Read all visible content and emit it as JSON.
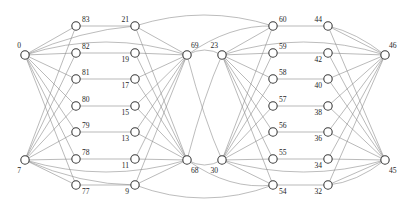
{
  "figure": {
    "width": 408,
    "height": 213,
    "background_color": "#ffffff",
    "node_stroke_color": "#3b3b3b",
    "node_fill_color": "#ffffff",
    "edge_color": "#8c8c8c",
    "label_color": "#262626",
    "node_radius": 4.2
  },
  "chart_data": {
    "type": "graph",
    "title": "",
    "layout": "layered-columns",
    "columns": [
      {
        "name": "column-a-hubs",
        "x": 25,
        "nodes": [
          {
            "id": "0",
            "label": "0",
            "x": 25,
            "y": 55,
            "label_dx": -4,
            "label_dy": -7,
            "anchor": "end"
          },
          {
            "id": "7",
            "label": "7",
            "x": 25,
            "y": 160,
            "label_dx": -4,
            "label_dy": 13,
            "anchor": "end"
          }
        ]
      },
      {
        "name": "column-b",
        "x": 76,
        "nodes": [
          {
            "id": "83",
            "label": "83",
            "x": 76,
            "y": 26,
            "label_dx": 6,
            "label_dy": -4,
            "anchor": "start"
          },
          {
            "id": "82",
            "label": "82",
            "x": 76,
            "y": 53,
            "label_dx": 6,
            "label_dy": -4,
            "anchor": "start"
          },
          {
            "id": "81",
            "label": "81",
            "x": 76,
            "y": 79,
            "label_dx": 6,
            "label_dy": -4,
            "anchor": "start"
          },
          {
            "id": "80",
            "label": "80",
            "x": 76,
            "y": 106,
            "label_dx": 6,
            "label_dy": -4,
            "anchor": "start"
          },
          {
            "id": "79",
            "label": "79",
            "x": 76,
            "y": 132,
            "label_dx": 6,
            "label_dy": -4,
            "anchor": "start"
          },
          {
            "id": "78",
            "label": "78",
            "x": 76,
            "y": 159,
            "label_dx": 6,
            "label_dy": -4,
            "anchor": "start"
          },
          {
            "id": "77",
            "label": "77",
            "x": 76,
            "y": 185,
            "label_dx": 6,
            "label_dy": 9,
            "anchor": "start"
          }
        ]
      },
      {
        "name": "column-c",
        "x": 135,
        "nodes": [
          {
            "id": "21",
            "label": "21",
            "x": 135,
            "y": 26,
            "label_dx": -6,
            "label_dy": -4,
            "anchor": "end"
          },
          {
            "id": "19",
            "label": "19",
            "x": 135,
            "y": 53,
            "label_dx": -6,
            "label_dy": 9,
            "anchor": "end"
          },
          {
            "id": "17",
            "label": "17",
            "x": 135,
            "y": 79,
            "label_dx": -6,
            "label_dy": 9,
            "anchor": "end"
          },
          {
            "id": "15",
            "label": "15",
            "x": 135,
            "y": 106,
            "label_dx": -6,
            "label_dy": 9,
            "anchor": "end"
          },
          {
            "id": "13",
            "label": "13",
            "x": 135,
            "y": 132,
            "label_dx": -6,
            "label_dy": 9,
            "anchor": "end"
          },
          {
            "id": "11",
            "label": "11",
            "x": 135,
            "y": 159,
            "label_dx": -6,
            "label_dy": 9,
            "anchor": "end"
          },
          {
            "id": "9",
            "label": "9",
            "x": 135,
            "y": 185,
            "label_dx": -6,
            "label_dy": 9,
            "anchor": "end"
          }
        ]
      },
      {
        "name": "column-d-hubs",
        "x": 187,
        "nodes": [
          {
            "id": "69",
            "label": "69",
            "x": 187,
            "y": 55,
            "label_dx": 4,
            "label_dy": -7,
            "anchor": "start"
          },
          {
            "id": "68",
            "label": "68",
            "x": 187,
            "y": 160,
            "label_dx": 4,
            "label_dy": 13,
            "anchor": "start"
          }
        ]
      },
      {
        "name": "column-e-hubs",
        "x": 222,
        "nodes": [
          {
            "id": "23",
            "label": "23",
            "x": 222,
            "y": 55,
            "label_dx": -4,
            "label_dy": -7,
            "anchor": "end"
          },
          {
            "id": "30",
            "label": "30",
            "x": 222,
            "y": 160,
            "label_dx": -4,
            "label_dy": 13,
            "anchor": "end"
          }
        ]
      },
      {
        "name": "column-f",
        "x": 273,
        "nodes": [
          {
            "id": "60",
            "label": "60",
            "x": 273,
            "y": 26,
            "label_dx": 6,
            "label_dy": -4,
            "anchor": "start"
          },
          {
            "id": "59",
            "label": "59",
            "x": 273,
            "y": 53,
            "label_dx": 6,
            "label_dy": -4,
            "anchor": "start"
          },
          {
            "id": "58",
            "label": "58",
            "x": 273,
            "y": 79,
            "label_dx": 6,
            "label_dy": -4,
            "anchor": "start"
          },
          {
            "id": "57",
            "label": "57",
            "x": 273,
            "y": 106,
            "label_dx": 6,
            "label_dy": -4,
            "anchor": "start"
          },
          {
            "id": "56",
            "label": "56",
            "x": 273,
            "y": 132,
            "label_dx": 6,
            "label_dy": -4,
            "anchor": "start"
          },
          {
            "id": "55",
            "label": "55",
            "x": 273,
            "y": 159,
            "label_dx": 6,
            "label_dy": -4,
            "anchor": "start"
          },
          {
            "id": "54",
            "label": "54",
            "x": 273,
            "y": 185,
            "label_dx": 6,
            "label_dy": 9,
            "anchor": "start"
          }
        ]
      },
      {
        "name": "column-g",
        "x": 328,
        "nodes": [
          {
            "id": "44",
            "label": "44",
            "x": 328,
            "y": 26,
            "label_dx": -6,
            "label_dy": -4,
            "anchor": "end"
          },
          {
            "id": "42",
            "label": "42",
            "x": 328,
            "y": 53,
            "label_dx": -6,
            "label_dy": 9,
            "anchor": "end"
          },
          {
            "id": "40",
            "label": "40",
            "x": 328,
            "y": 79,
            "label_dx": -6,
            "label_dy": 9,
            "anchor": "end"
          },
          {
            "id": "38",
            "label": "38",
            "x": 328,
            "y": 106,
            "label_dx": -6,
            "label_dy": 9,
            "anchor": "end"
          },
          {
            "id": "36",
            "label": "36",
            "x": 328,
            "y": 132,
            "label_dx": -6,
            "label_dy": 9,
            "anchor": "end"
          },
          {
            "id": "34",
            "label": "34",
            "x": 328,
            "y": 159,
            "label_dx": -6,
            "label_dy": 9,
            "anchor": "end"
          },
          {
            "id": "32",
            "label": "32",
            "x": 328,
            "y": 185,
            "label_dx": -6,
            "label_dy": 9,
            "anchor": "end"
          }
        ]
      },
      {
        "name": "column-h-hubs",
        "x": 385,
        "nodes": [
          {
            "id": "46",
            "label": "46",
            "x": 385,
            "y": 55,
            "label_dx": 4,
            "label_dy": -7,
            "anchor": "start"
          },
          {
            "id": "45",
            "label": "45",
            "x": 385,
            "y": 160,
            "label_dx": 4,
            "label_dy": 13,
            "anchor": "start"
          }
        ]
      }
    ],
    "straight_edges": [
      [
        "0",
        "83"
      ],
      [
        "0",
        "82"
      ],
      [
        "0",
        "81"
      ],
      [
        "0",
        "80"
      ],
      [
        "0",
        "79"
      ],
      [
        "0",
        "78"
      ],
      [
        "0",
        "77"
      ],
      [
        "7",
        "83"
      ],
      [
        "7",
        "82"
      ],
      [
        "7",
        "81"
      ],
      [
        "7",
        "80"
      ],
      [
        "7",
        "79"
      ],
      [
        "7",
        "78"
      ],
      [
        "7",
        "77"
      ],
      [
        "83",
        "21"
      ],
      [
        "82",
        "19"
      ],
      [
        "81",
        "17"
      ],
      [
        "80",
        "15"
      ],
      [
        "79",
        "13"
      ],
      [
        "78",
        "11"
      ],
      [
        "77",
        "9"
      ],
      [
        "21",
        "69"
      ],
      [
        "19",
        "69"
      ],
      [
        "17",
        "69"
      ],
      [
        "15",
        "69"
      ],
      [
        "13",
        "69"
      ],
      [
        "11",
        "69"
      ],
      [
        "9",
        "69"
      ],
      [
        "21",
        "68"
      ],
      [
        "19",
        "68"
      ],
      [
        "17",
        "68"
      ],
      [
        "15",
        "68"
      ],
      [
        "13",
        "68"
      ],
      [
        "11",
        "68"
      ],
      [
        "9",
        "68"
      ],
      [
        "23",
        "60"
      ],
      [
        "23",
        "59"
      ],
      [
        "23",
        "58"
      ],
      [
        "23",
        "57"
      ],
      [
        "23",
        "56"
      ],
      [
        "23",
        "55"
      ],
      [
        "23",
        "54"
      ],
      [
        "30",
        "60"
      ],
      [
        "30",
        "59"
      ],
      [
        "30",
        "58"
      ],
      [
        "30",
        "57"
      ],
      [
        "30",
        "56"
      ],
      [
        "30",
        "55"
      ],
      [
        "30",
        "54"
      ],
      [
        "60",
        "44"
      ],
      [
        "59",
        "42"
      ],
      [
        "58",
        "40"
      ],
      [
        "57",
        "38"
      ],
      [
        "56",
        "36"
      ],
      [
        "55",
        "34"
      ],
      [
        "54",
        "32"
      ],
      [
        "44",
        "46"
      ],
      [
        "42",
        "46"
      ],
      [
        "40",
        "46"
      ],
      [
        "38",
        "46"
      ],
      [
        "36",
        "46"
      ],
      [
        "34",
        "46"
      ],
      [
        "32",
        "46"
      ],
      [
        "44",
        "45"
      ],
      [
        "42",
        "45"
      ],
      [
        "40",
        "45"
      ],
      [
        "38",
        "45"
      ],
      [
        "36",
        "45"
      ],
      [
        "34",
        "45"
      ],
      [
        "32",
        "45"
      ]
    ],
    "curved_edges": [
      {
        "from": "0",
        "to": "69",
        "curvature": -26
      },
      {
        "from": "7",
        "to": "68",
        "curvature": 24
      },
      {
        "from": "23",
        "to": "46",
        "curvature": -26
      },
      {
        "from": "30",
        "to": "45",
        "curvature": 24
      },
      {
        "from": "21",
        "to": "60",
        "curvature": -22
      },
      {
        "from": "9",
        "to": "54",
        "curvature": 26
      },
      {
        "from": "69",
        "to": "23",
        "curvature": -10
      },
      {
        "from": "68",
        "to": "30",
        "curvature": 10
      },
      {
        "from": "69",
        "to": "30",
        "curvature": 14
      },
      {
        "from": "68",
        "to": "23",
        "curvature": -14
      },
      {
        "from": "0",
        "to": "21",
        "curvature": -10
      },
      {
        "from": "7",
        "to": "9",
        "curvature": 12
      },
      {
        "from": "44",
        "to": "46",
        "curvature": -8
      },
      {
        "from": "32",
        "to": "45",
        "curvature": 10
      },
      {
        "from": "69",
        "to": "60",
        "curvature": -16
      },
      {
        "from": "68",
        "to": "54",
        "curvature": 18
      }
    ]
  }
}
